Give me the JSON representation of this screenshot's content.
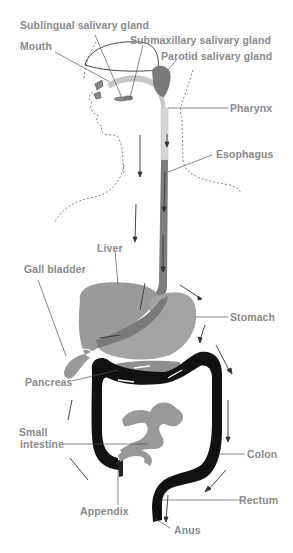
{
  "diagram": {
    "colors": {
      "label": "#8a8a8a",
      "organ_light": "#a9a9a9",
      "organ_mid": "#8c8c8c",
      "organ_dark": "#6f6f6f",
      "colon": "#111111",
      "esophagus_upper": "#d8d8d8",
      "line": "#555555",
      "dashed": "#666666"
    },
    "labels": {
      "sublingual": "Sublingual salivary gland",
      "submaxillary": "Submaxillary salivary gland",
      "parotid": "Parotid salivary gland",
      "mouth": "Mouth",
      "pharynx": "Pharynx",
      "esophagus": "Esophagus",
      "liver": "Liver",
      "gall_bladder": "Gall bladder",
      "stomach": "Stomach",
      "pancreas": "Pancreas",
      "small_intestine_1": "Small",
      "small_intestine_2": "intestine",
      "colon": "Colon",
      "appendix": "Appendix",
      "rectum": "Rectum",
      "anus": "Anus"
    }
  }
}
